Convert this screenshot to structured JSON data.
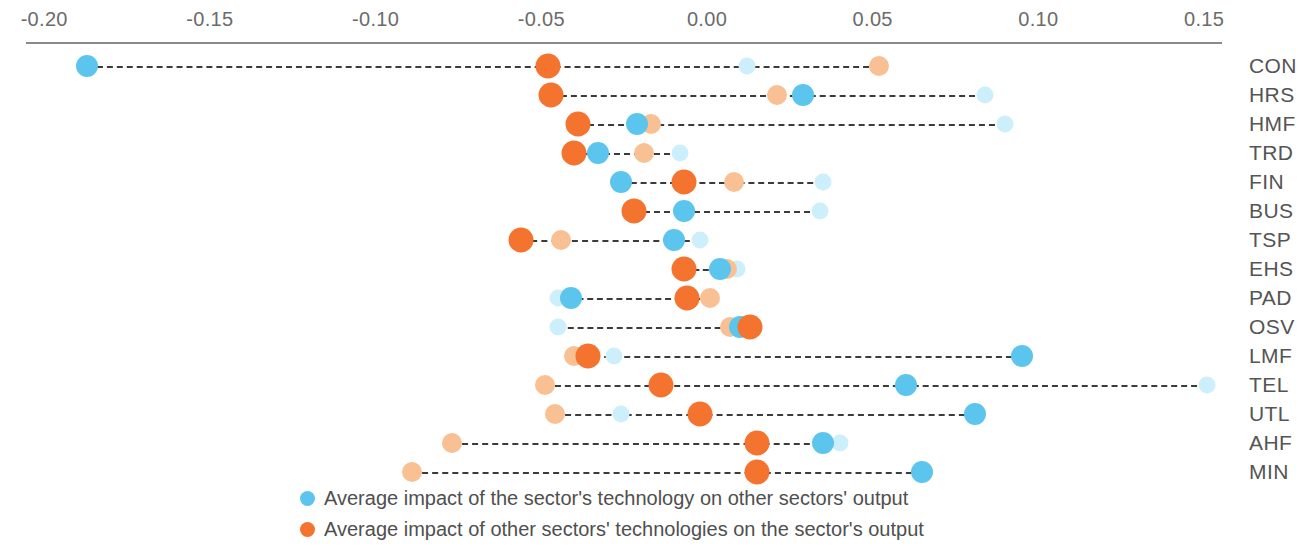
{
  "chart_data": {
    "type": "scatter",
    "title": "",
    "xlabel": "",
    "ylabel": "",
    "xlim": [
      -0.2,
      0.15
    ],
    "grid": false,
    "legend_position": "bottom",
    "tick_labels": [
      "-0.20",
      "-0.15",
      "-0.10",
      "-0.05",
      "0.00",
      "0.05",
      "0.10",
      "0.15"
    ],
    "tick_values": [
      -0.2,
      -0.15,
      -0.1,
      -0.05,
      0.0,
      0.05,
      0.1,
      0.15
    ],
    "categories": [
      "CON",
      "HRS",
      "HMF",
      "TRD",
      "FIN",
      "BUS",
      "TSP",
      "EHS",
      "PAD",
      "OSV",
      "LMF",
      "TEL",
      "UTL",
      "AHF",
      "MIN"
    ],
    "series": [
      {
        "name": "outward_dark_blue",
        "label": "Average impact of the sector's technology on other sectors' output",
        "color": "#5bc5ee",
        "values": [
          -0.187,
          0.029,
          -0.021,
          -0.033,
          -0.026,
          -0.007,
          -0.01,
          0.004,
          -0.041,
          0.01,
          0.095,
          0.06,
          0.081,
          0.035,
          0.065
        ]
      },
      {
        "name": "outward_light_blue",
        "label": "Average impact of the sector's technology on other sectors' output (light)",
        "color": "#cdeffb",
        "values": [
          0.012,
          0.084,
          0.09,
          -0.008,
          0.035,
          0.034,
          -0.002,
          0.009,
          -0.045,
          -0.045,
          -0.028,
          0.151,
          -0.026,
          0.04,
          null
        ]
      },
      {
        "name": "inward_dark_orange",
        "label": "Average impact of other sectors' technologies on the sector's output",
        "color": "#f4732e",
        "values": [
          -0.048,
          -0.047,
          -0.039,
          -0.04,
          -0.007,
          -0.022,
          -0.056,
          -0.007,
          -0.006,
          0.013,
          -0.036,
          -0.014,
          -0.002,
          0.015,
          0.015
        ]
      },
      {
        "name": "inward_light_orange",
        "label": "Average impact of other sectors' technologies on the sector's output (light)",
        "color": "#f9c193",
        "values": [
          0.052,
          0.021,
          -0.017,
          -0.019,
          0.008,
          null,
          -0.044,
          0.006,
          0.001,
          0.007,
          -0.04,
          -0.049,
          -0.046,
          -0.077,
          -0.089
        ]
      }
    ]
  },
  "legend": {
    "entries": [
      {
        "swatch": "blue",
        "text": "Average impact of the sector's technology on other sectors' output"
      },
      {
        "swatch": "orange",
        "text": "Average impact of other sectors' technologies on the sector's output"
      }
    ]
  }
}
